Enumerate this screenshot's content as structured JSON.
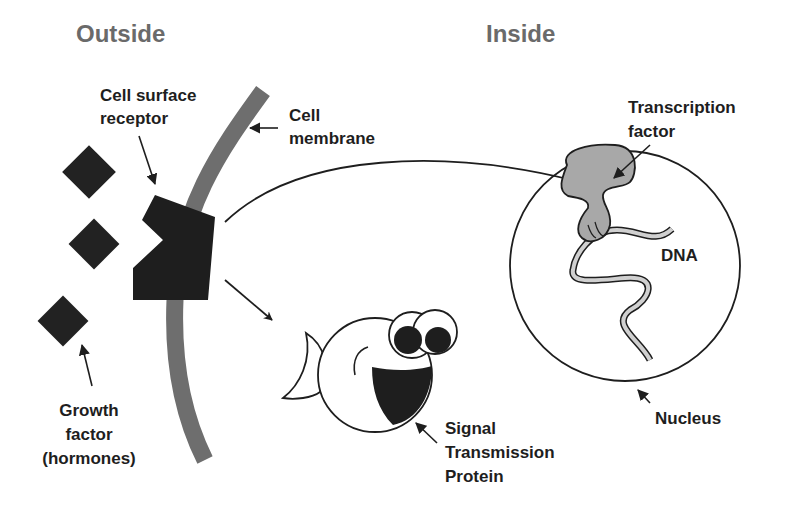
{
  "headers": {
    "outside": "Outside",
    "inside": "Inside"
  },
  "labels": {
    "cell_surface_receptor": [
      "Cell surface",
      "receptor"
    ],
    "cell_membrane": [
      "Cell",
      "membrane"
    ],
    "transcription_factor": [
      "Transcription",
      "factor"
    ],
    "dna": "DNA",
    "growth_factor": [
      "Growth",
      "factor",
      "(hormones)"
    ],
    "signal_transmission_protein": [
      "Signal",
      "Transmission",
      "Protein"
    ],
    "nucleus": "Nucleus"
  },
  "colors": {
    "membrane": "#6e6e6e",
    "receptor": "#1e1e1e",
    "growth_factor": "#222222",
    "transcription_factor": "#a8a8a8",
    "header_text": "#6a6a6a",
    "line": "#1e1e1e",
    "dna_fill": "#d0d0d0"
  }
}
